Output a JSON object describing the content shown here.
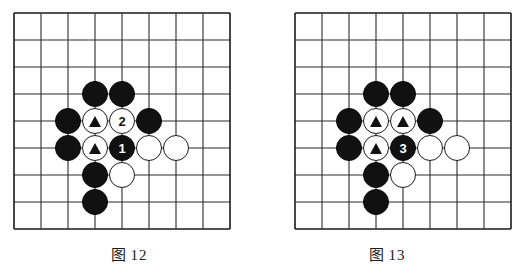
{
  "page": {
    "background_color": "#ffffff",
    "width": 516,
    "height": 277
  },
  "board": {
    "columns": 9,
    "rows": 9,
    "line_color": "#2b2b2b",
    "border_color": "#1a1a1a",
    "cell_size": 27,
    "black_color": "#111111",
    "white_color": "#ffffff"
  },
  "figures": [
    {
      "id": "figure-12",
      "caption_label": "图",
      "caption_number": "12",
      "stones": [
        {
          "color": "black",
          "col": 3,
          "row": 3,
          "marker": "none",
          "label": ""
        },
        {
          "color": "black",
          "col": 4,
          "row": 3,
          "marker": "none",
          "label": ""
        },
        {
          "color": "black",
          "col": 2,
          "row": 4,
          "marker": "none",
          "label": ""
        },
        {
          "color": "white",
          "col": 3,
          "row": 4,
          "marker": "triangle",
          "label": ""
        },
        {
          "color": "white",
          "col": 4,
          "row": 4,
          "marker": "number",
          "label": "2"
        },
        {
          "color": "black",
          "col": 5,
          "row": 4,
          "marker": "none",
          "label": ""
        },
        {
          "color": "black",
          "col": 2,
          "row": 5,
          "marker": "none",
          "label": ""
        },
        {
          "color": "white",
          "col": 3,
          "row": 5,
          "marker": "triangle",
          "label": ""
        },
        {
          "color": "black",
          "col": 4,
          "row": 5,
          "marker": "number",
          "label": "1"
        },
        {
          "color": "white",
          "col": 5,
          "row": 5,
          "marker": "none",
          "label": ""
        },
        {
          "color": "white",
          "col": 6,
          "row": 5,
          "marker": "none",
          "label": ""
        },
        {
          "color": "black",
          "col": 3,
          "row": 6,
          "marker": "none",
          "label": ""
        },
        {
          "color": "white",
          "col": 4,
          "row": 6,
          "marker": "none",
          "label": ""
        },
        {
          "color": "black",
          "col": 3,
          "row": 7,
          "marker": "none",
          "label": ""
        }
      ]
    },
    {
      "id": "figure-13",
      "caption_label": "图",
      "caption_number": "13",
      "stones": [
        {
          "color": "black",
          "col": 3,
          "row": 3,
          "marker": "none",
          "label": ""
        },
        {
          "color": "black",
          "col": 4,
          "row": 3,
          "marker": "none",
          "label": ""
        },
        {
          "color": "black",
          "col": 2,
          "row": 4,
          "marker": "none",
          "label": ""
        },
        {
          "color": "white",
          "col": 3,
          "row": 4,
          "marker": "triangle",
          "label": ""
        },
        {
          "color": "white",
          "col": 4,
          "row": 4,
          "marker": "triangle",
          "label": ""
        },
        {
          "color": "black",
          "col": 5,
          "row": 4,
          "marker": "none",
          "label": ""
        },
        {
          "color": "black",
          "col": 2,
          "row": 5,
          "marker": "none",
          "label": ""
        },
        {
          "color": "white",
          "col": 3,
          "row": 5,
          "marker": "triangle",
          "label": ""
        },
        {
          "color": "black",
          "col": 4,
          "row": 5,
          "marker": "number",
          "label": "3"
        },
        {
          "color": "white",
          "col": 5,
          "row": 5,
          "marker": "none",
          "label": ""
        },
        {
          "color": "white",
          "col": 6,
          "row": 5,
          "marker": "none",
          "label": ""
        },
        {
          "color": "black",
          "col": 3,
          "row": 6,
          "marker": "none",
          "label": ""
        },
        {
          "color": "white",
          "col": 4,
          "row": 6,
          "marker": "none",
          "label": ""
        },
        {
          "color": "black",
          "col": 3,
          "row": 7,
          "marker": "none",
          "label": ""
        }
      ]
    }
  ]
}
